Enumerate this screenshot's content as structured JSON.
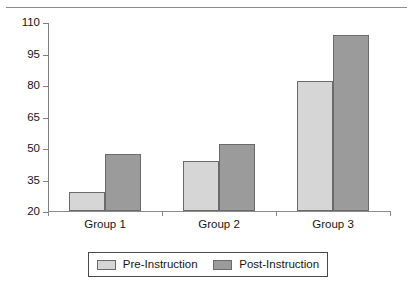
{
  "chart_data": {
    "type": "bar",
    "title": "",
    "subtitle": "",
    "xlabel": "",
    "ylabel": "",
    "categories": [
      "Group 1",
      "Group 2",
      "Group 3"
    ],
    "series": [
      {
        "name": "Pre-Instruction",
        "color": "#d6d6d6",
        "values": [
          29,
          44,
          82
        ]
      },
      {
        "name": "Post-Instruction",
        "color": "#9b9b9b",
        "values": [
          47,
          52,
          104
        ]
      }
    ],
    "ylim": [
      20,
      110
    ],
    "ytick_values": [
      20,
      35,
      50,
      65,
      80,
      95,
      110
    ],
    "ytick_labels": [
      "20",
      "35",
      "50",
      "65",
      "80",
      "95",
      "110"
    ],
    "grid": false,
    "legend_position": "bottom",
    "annotations": []
  },
  "legend": {
    "entries": [
      {
        "label": "Pre-Instruction",
        "swatch": "pre"
      },
      {
        "label": "Post-Instruction",
        "swatch": "post"
      }
    ]
  }
}
